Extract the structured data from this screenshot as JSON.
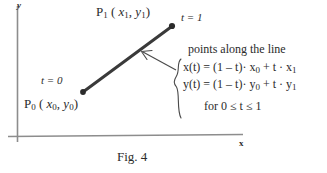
{
  "figure": {
    "caption": "Fig. 4",
    "axes": {
      "y_label": "y",
      "x_label": "x"
    },
    "points": [
      {
        "id": "p1",
        "label": "P",
        "label_sub": "1",
        "coords_open": " ( ",
        "coord_x": "x",
        "coord_x_sub": "1",
        "coord_sep": ", ",
        "coord_y": "y",
        "coord_y_sub": "1",
        "coords_close": ")",
        "param_label": "t = 1"
      },
      {
        "id": "p0",
        "label": "P",
        "label_sub": "0",
        "coords_open": " ( ",
        "coord_x": "x",
        "coord_x_sub": "0",
        "coord_sep": ", ",
        "coord_y": "y",
        "coord_y_sub": "0",
        "coords_close": ")",
        "param_label": "t = 0"
      }
    ],
    "annotation": {
      "heading": "points along the line",
      "equation_x": {
        "lhs": "x(t) = (1 – t)· x",
        "lhs_sub": "0",
        "rhs": " + t · x",
        "rhs_sub": "1"
      },
      "equation_y": {
        "lhs": "y(t) = (1 – t)· y",
        "lhs_sub": "0",
        "rhs": " + t · y",
        "rhs_sub": "1"
      },
      "range": "for 0 ≤ t ≤ 1"
    },
    "colors": {
      "ink": "#2b2b2b",
      "segment": "#3a3a3a",
      "axis": "#8d8d8d",
      "background": "#ffffff"
    }
  }
}
